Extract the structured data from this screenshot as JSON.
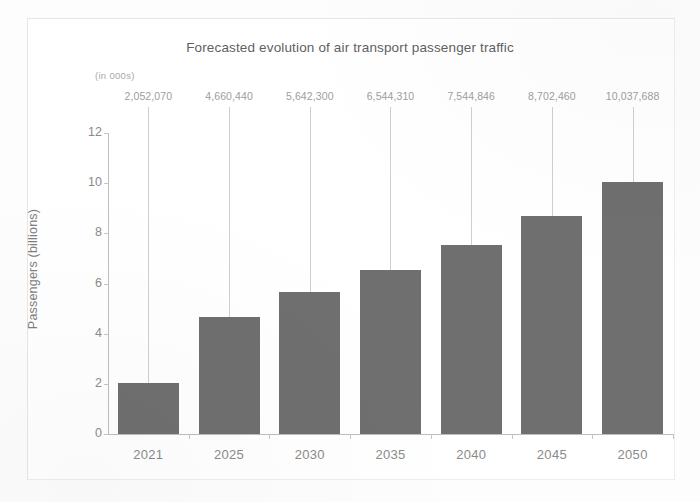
{
  "chart_data": {
    "type": "bar",
    "title": "Forecasted evolution of air transport passenger traffic",
    "subtitle": "(in 000s)",
    "xlabel": "",
    "ylabel": "Passengers (billions)",
    "categories": [
      "2021",
      "2025",
      "2030",
      "2035",
      "2040",
      "2045",
      "2050"
    ],
    "values": [
      2.05207,
      4.66044,
      5.6423,
      6.54431,
      7.544846,
      8.70246,
      10.037688
    ],
    "data_labels": [
      "2,052,070",
      "4,660,440",
      "5,642,300",
      "6,544,310",
      "7,544,846",
      "8,702,460",
      "10,037,688"
    ],
    "data_label_units": "thousands",
    "ylim": [
      0,
      12
    ],
    "yticks": [
      "0",
      "2",
      "4",
      "6",
      "8",
      "10",
      "12"
    ],
    "ytick_values": [
      0,
      2,
      4,
      6,
      8,
      10,
      12
    ],
    "grid": false,
    "legend": false,
    "bar_color": "#6f6f6f",
    "axis_color": "#bdbdbd",
    "text_color": "#8a8a8a",
    "label_color": "#9d9d9d",
    "background": "#ffffff",
    "leader_lines": true
  }
}
